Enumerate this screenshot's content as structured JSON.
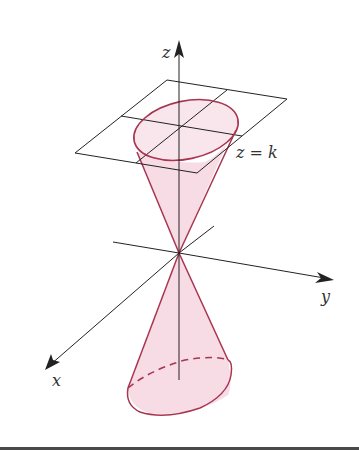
{
  "figure": {
    "labels": {
      "z_axis": "z",
      "x_axis": "x",
      "y_axis": "y",
      "plane": "z = k"
    },
    "colors": {
      "cone_fill": "#f7dce6",
      "cone_edge": "#a8354f",
      "axis": "#222222",
      "plane": "#222222"
    }
  }
}
